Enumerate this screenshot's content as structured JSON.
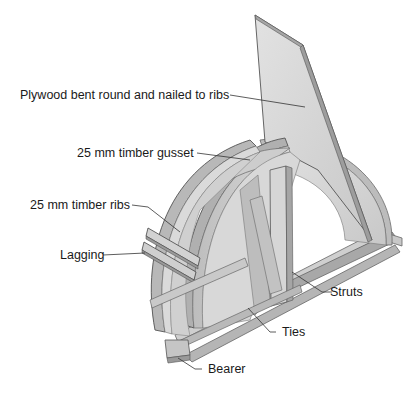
{
  "diagram": {
    "labels": {
      "plywood": "Plywood bent round and nailed to ribs",
      "gusset": "25 mm timber gusset",
      "ribs": "25 mm timber ribs",
      "lagging": "Lagging",
      "struts": "Struts",
      "ties": "Ties",
      "bearer": "Bearer"
    },
    "colors": {
      "background": "#ffffff",
      "timber_light": "#dcdcdc",
      "timber_mid": "#c4c4c4",
      "timber_dark": "#9a9a9a",
      "outline": "#555555",
      "leader": "#333333",
      "text": "#1a1a1a"
    }
  }
}
